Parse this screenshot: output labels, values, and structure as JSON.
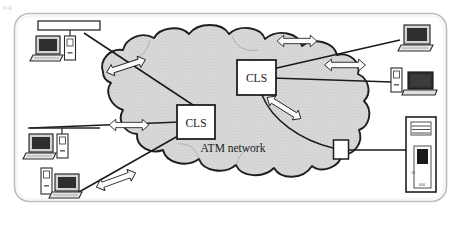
{
  "figure": {
    "background_color": "#ffffff",
    "frame": {
      "name": "outer-rounded-frame",
      "stroke": "#b9b9b9",
      "fill": "#ffffff",
      "corner_radius": 14
    },
    "corner_artifact": "p.g"
  },
  "cloud": {
    "label": "ATM network",
    "fill": "#d9d9d9",
    "stroke": "#1e1e1e",
    "hatch": "halftone-dots"
  },
  "nodes": [
    {
      "id": "cls-right",
      "type": "server-box",
      "label": "CLS",
      "fill": "#ffffff",
      "stroke": "#141414",
      "x": 237,
      "y": 60,
      "width": 39,
      "height": 35
    },
    {
      "id": "cls-left",
      "type": "server-box",
      "label": "CLS",
      "fill": "#ffffff",
      "stroke": "#141414",
      "x": 177,
      "y": 105,
      "width": 38,
      "height": 34
    }
  ],
  "edge_device": {
    "name": "edge-connector-box",
    "fill": "#ffffff",
    "stroke": "#1e1e1e"
  },
  "arrows": [
    {
      "id": "arrow-upper-left",
      "label": "bidirectional-link",
      "angle": -18,
      "x": 126,
      "y": 66
    },
    {
      "id": "arrow-top-center",
      "label": "bidirectional-link",
      "angle": 0,
      "x": 297,
      "y": 41
    },
    {
      "id": "arrow-right-upper",
      "label": "bidirectional-link",
      "angle": 0,
      "x": 345,
      "y": 65
    },
    {
      "id": "arrow-mid-left",
      "label": "bidirectional-link",
      "angle": 0,
      "x": 129,
      "y": 125
    },
    {
      "id": "arrow-cls-lower",
      "label": "bidirectional-link",
      "angle": 32,
      "x": 284,
      "y": 108
    },
    {
      "id": "arrow-bottom-left",
      "label": "bidirectional-link",
      "angle": -20,
      "x": 116,
      "y": 180
    }
  ],
  "hosts": [
    {
      "id": "host-top-left",
      "type": "desktop-with-tower",
      "bus": "lan-segment-bar"
    },
    {
      "id": "host-mid-left",
      "type": "desktop-with-tower",
      "bus": "lan-segment-bar"
    },
    {
      "id": "host-bottom-left",
      "type": "desktop-with-tower",
      "bus": "none"
    },
    {
      "id": "host-top-right",
      "type": "desktop-workstation",
      "bus": "none"
    },
    {
      "id": "host-mid-right",
      "type": "laptop-with-tower",
      "bus": "none"
    },
    {
      "id": "host-server-right",
      "type": "server-tower",
      "bus": "none"
    }
  ],
  "server_tower": {
    "name": "server-tower",
    "fill": "#ffffff",
    "stroke": "#1e1e1e",
    "drive_bay_color": "#1a1a1a",
    "front_marks": [
      "18",
      "000"
    ]
  }
}
